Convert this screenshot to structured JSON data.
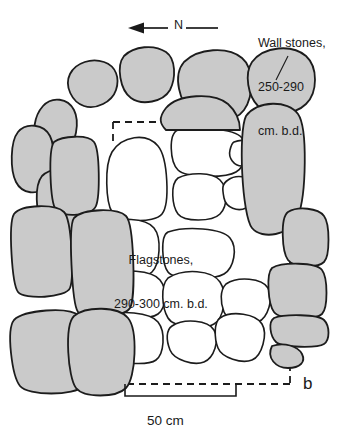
{
  "figure": {
    "panel_label": "b",
    "background_color": "#ffffff"
  },
  "annotations": {
    "wall_stones": {
      "line1": "Wall stones,",
      "line2": "250-290",
      "line3": "cm. b.d."
    },
    "flagstones": {
      "line1": "Flagstones,",
      "line2": "290-300 cm. b.d."
    }
  },
  "north_arrow": {
    "label": "N",
    "direction": "left"
  },
  "scale_bar": {
    "label": "50 cm",
    "length_cm": 50
  },
  "legend_colors": {
    "wall_stone_fill": "#cacaca",
    "flagstone_fill": "#ffffff",
    "stone_outline": "#1c1c1c",
    "excavation_boundary": "#1c1c1c"
  },
  "plan": {
    "wall_stones": [
      "M 70,74 C 76,62 92,58 104,62 C 116,66 120,78 116,90 C 112,102 96,110 84,106 C 72,102 64,86 70,74 Z",
      "M 124,56 C 134,46 154,44 166,52 C 176,59 176,78 170,90 C 163,102 142,106 131,98 C 120,90 116,66 124,56 Z",
      "M 43,106 C 52,96 68,98 74,110 C 80,122 76,144 66,152 C 56,160 42,156 37,144 C 32,132 34,116 43,106 Z",
      "M 184,62 C 198,48 228,46 242,58 C 254,68 254,96 244,110 C 234,124 204,126 192,114 C 180,102 172,76 184,62 Z",
      "M 252,62 C 264,46 292,44 306,56 C 318,67 318,92 306,104 C 294,116 268,116 258,106 C 248,96 244,74 252,62 Z",
      "M 18,132 C 26,122 44,124 50,136 C 56,148 54,176 46,186 C 38,196 22,194 16,182 C 10,170 10,142 18,132 Z",
      "M 42,176 C 52,166 72,168 78,180 C 84,192 82,218 74,228 C 66,238 48,236 42,224 C 36,212 34,186 42,176 Z",
      "M 54,142 C 62,136 88,134 94,142 C 100,150 100,196 96,206 C 92,216 62,218 56,210 C 50,202 48,150 54,142 Z",
      "M 166,108 C 178,94 214,92 228,104 C 238,113 240,122 240,130 L 166,130 C 160,124 158,118 166,108 Z",
      "M 246,116 C 258,100 288,100 298,114 C 308,128 306,196 298,216 C 290,236 262,240 252,228 C 242,216 238,132 246,116 Z",
      "M 14,214 C 22,204 56,204 64,212 C 72,220 74,278 70,288 C 66,298 24,300 18,292 C 12,284 8,224 14,214 Z",
      "M 74,218 C 84,208 118,208 126,216 C 134,224 136,298 130,308 C 124,318 84,320 78,312 C 72,304 68,226 74,218 Z",
      "M 14,320 C 24,310 68,306 80,316 C 92,326 94,376 84,386 C 74,396 28,396 20,386 C 12,376 6,330 14,320 Z",
      "M 74,316 C 86,306 118,306 128,318 C 138,330 136,378 126,388 C 116,398 84,398 76,388 C 68,378 64,326 74,316 Z",
      "M 288,212 C 298,206 318,208 324,216 C 330,224 330,256 324,262 C 318,268 294,268 288,260 C 282,252 280,218 288,212 Z",
      "M 272,268 C 282,262 316,262 322,270 C 328,278 328,308 322,314 C 316,320 280,320 274,312 C 268,304 266,274 272,268 Z",
      "M 274,318 C 284,314 318,314 324,320 C 330,326 330,340 324,344 C 318,348 282,348 276,342 C 270,336 268,322 274,318 Z",
      "M 272,346 C 284,342 298,346 302,354 C 306,362 300,368 288,368 C 276,368 266,358 272,346 Z"
    ],
    "flagstones": [
      "M 112,152 C 122,136 146,132 158,146 C 168,158 170,204 162,214 C 154,224 118,222 112,212 C 106,202 104,166 112,152 Z",
      "M 178,130 C 194,126 234,128 242,138 C 250,148 246,166 236,172 C 226,178 186,178 178,170 C 170,162 168,134 178,130 Z",
      "M 252,130 C 260,124 276,124 282,132 C 288,140 286,186 280,194 C 274,202 258,200 254,192 C 250,184 246,136 252,130 Z",
      "M 178,178 C 190,172 212,172 220,180 C 228,188 228,206 220,214 C 212,222 184,222 178,214 C 172,206 170,184 178,178 Z",
      "M 228,180 C 236,174 250,176 254,184 C 258,192 254,204 246,208 C 238,212 226,208 224,198 C 222,188 222,184 228,180 Z",
      "M 104,226 C 118,216 146,218 154,228 C 162,238 160,264 152,272 C 144,280 110,280 104,270 C 98,260 96,234 104,226 Z",
      "M 168,232 C 186,226 222,228 230,238 C 238,248 234,268 224,274 C 214,280 174,280 168,272 C 162,264 160,236 168,232 Z",
      "M 106,276 C 122,268 152,270 160,280 C 168,290 166,308 158,314 C 150,320 112,320 106,312 C 100,304 98,282 106,276 Z",
      "M 168,278 C 184,268 212,270 220,282 C 228,294 224,318 214,324 C 204,330 174,328 168,318 C 162,308 160,286 168,278 Z",
      "M 226,284 C 238,276 262,278 268,288 C 274,298 268,318 258,322 C 248,326 228,322 224,312 C 220,302 220,290 226,284 Z",
      "M 104,316 C 120,310 150,312 158,322 C 166,332 164,354 156,360 C 148,366 112,364 106,356 C 100,348 98,322 104,316 Z",
      "M 172,326 C 184,318 208,320 214,330 C 220,340 214,358 204,362 C 194,366 174,360 170,350 C 166,340 166,330 172,326 Z",
      "M 220,318 C 232,310 256,314 262,324 C 268,334 262,356 252,360 C 242,364 222,358 218,348 C 214,338 214,322 220,318 Z",
      "M 234,142 C 244,138 252,142 254,150 C 256,158 250,166 242,166 C 234,166 228,158 230,150 C 231,146 232,143 234,142 Z"
    ],
    "boundary_path": "M 113,122 L 192,122 M 113,122 L 113,146 M 290,232 L 290,384 M 290,384 L 116,384",
    "leader_line": {
      "x1": 288,
      "y1": 56,
      "x2": 276,
      "y2": 80
    },
    "north_arrow_geom": {
      "x1": 128,
      "y1": 28,
      "x2": 218,
      "y2": 28
    },
    "scale_bar_geom": {
      "x1": 125,
      "y1": 396,
      "x2": 236,
      "y2": 396,
      "tick_height": 12
    }
  }
}
